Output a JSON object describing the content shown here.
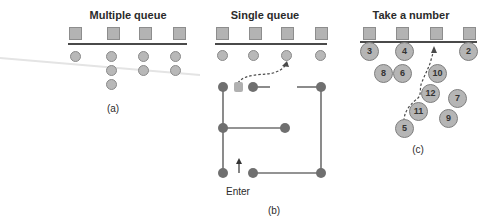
{
  "panels": {
    "a": {
      "title": "Multiple queue",
      "caption": "(a)"
    },
    "b": {
      "title": "Single queue",
      "caption": "(b)",
      "enter_label": "Enter"
    },
    "c": {
      "title": "Take a number",
      "caption": "(c)",
      "numbers": [
        "3",
        "4",
        "2",
        "8",
        "6",
        "10",
        "12",
        "7",
        "11",
        "9",
        "5"
      ]
    }
  },
  "colors": {
    "server": "#b3b3b3",
    "customer": "#b8b8b8",
    "path": "#6f6f6f",
    "line": "#4a4a4a"
  }
}
